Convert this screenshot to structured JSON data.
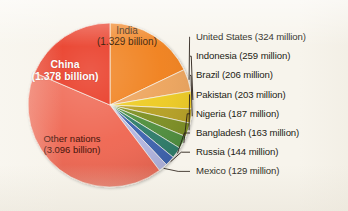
{
  "figure": {
    "background_color": "#f7f4ec",
    "text_color": "#231c14"
  },
  "chart_data": {
    "type": "pie",
    "title": "",
    "subtitle": "",
    "xlabel": "",
    "ylabel": "",
    "legend_position": "right",
    "grid": false,
    "units": "people",
    "total_label": "7.918 billion",
    "categories": [
      "India",
      "United States",
      "Indonesia",
      "Brazil",
      "Pakistan",
      "Nigeria",
      "Bangladesh",
      "Russia",
      "Mexico",
      "Other nations",
      "China"
    ],
    "values": [
      1.329,
      0.324,
      0.259,
      0.206,
      0.203,
      0.187,
      0.163,
      0.144,
      0.129,
      3.096,
      1.378
    ],
    "value_labels": [
      "1.329 billion",
      "324 million",
      "259 million",
      "206 million",
      "203 million",
      "187 million",
      "163 million",
      "144 million",
      "129 million",
      "3.096 billion",
      "1.378 billion"
    ],
    "colors": [
      "#f0801c",
      "#eda45c",
      "#eecb20",
      "#b6a022",
      "#7d8f22",
      "#4f8f3c",
      "#2f7d6b",
      "#3e63b0",
      "#b3b6e2",
      "#ef6651",
      "#e8301a"
    ]
  },
  "slice_labels": {
    "china": {
      "name": "China",
      "value": "(1.378 billion)"
    },
    "india": {
      "name": "India",
      "value": "(1.329 billion)"
    },
    "other": {
      "name": "Other nations",
      "value": "(3.096 billion)"
    }
  },
  "legend": {
    "items": [
      {
        "label": "United States (324 million)"
      },
      {
        "label": "Indonesia (259 million)"
      },
      {
        "label": "Brazil (206 million)"
      },
      {
        "label": "Pakistan (203 million)"
      },
      {
        "label": "Nigeria (187 million)"
      },
      {
        "label": "Bangladesh (163 million)"
      },
      {
        "label": "Russia (144 million)"
      },
      {
        "label": "Mexico (129 million)"
      }
    ]
  }
}
